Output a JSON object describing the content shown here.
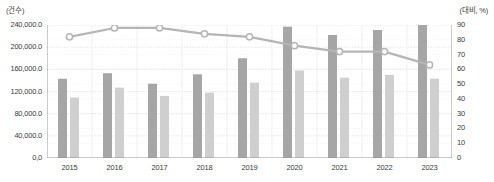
{
  "chart_data": {
    "type": "bar",
    "title": "",
    "subtitle": "",
    "xlabel": "",
    "ylabel": "(건수)",
    "y2label": "(대비, %)",
    "categories": [
      "2015",
      "2016",
      "2017",
      "2018",
      "2019",
      "2020",
      "2021",
      "2022",
      "2023"
    ],
    "ylim": [
      0,
      240000
    ],
    "y2lim": [
      0,
      90
    ],
    "yticks": [
      "0,0",
      "40,000.0",
      "80,000.0",
      "120,000.0",
      "160,000.0",
      "200,000.0",
      "240,000.0"
    ],
    "ytick_values": [
      0,
      40000,
      80000,
      120000,
      160000,
      200000,
      240000
    ],
    "y2ticks": [
      "0",
      "10",
      "20",
      "30",
      "40",
      "50",
      "60",
      "70",
      "80",
      "90"
    ],
    "y2tick_values": [
      0,
      10,
      20,
      30,
      40,
      50,
      60,
      70,
      80,
      90
    ],
    "grid": true,
    "legend": "none",
    "legend_position": "none",
    "series": [
      {
        "name": "series-dark-bar",
        "kind": "bar",
        "axis": "left",
        "color": "#a6a6a6",
        "values": [
          143000,
          153000,
          134000,
          151000,
          180000,
          237000,
          222000,
          231000,
          241000
        ]
      },
      {
        "name": "series-light-bar",
        "kind": "bar",
        "axis": "left",
        "color": "#cfcfcf",
        "values": [
          109000,
          127000,
          112000,
          118000,
          136000,
          158000,
          145000,
          150000,
          143000
        ]
      },
      {
        "name": "series-line-ratio",
        "kind": "line",
        "axis": "right",
        "color": "#b5b5b5",
        "marker": "open-circle",
        "values": [
          82,
          88,
          88,
          84,
          82,
          76,
          72,
          72,
          63
        ]
      }
    ]
  }
}
